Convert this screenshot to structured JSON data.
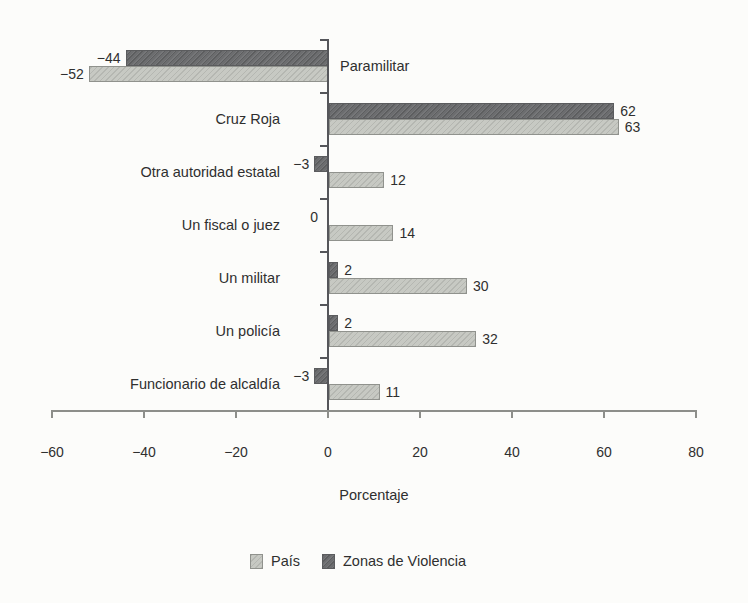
{
  "chart_data": {
    "type": "bar",
    "orientation": "horizontal",
    "title": "",
    "categories": [
      "Paramilitar",
      "Cruz Roja",
      "Otra autoridad estatal",
      "Un fiscal o juez",
      "Un militar",
      "Un policía",
      "Funcionario de alcaldía"
    ],
    "series": [
      {
        "name": "Zonas de Violencia",
        "role": "dark",
        "color": "#6c6d6f",
        "values": [
          -44,
          62,
          -3,
          0,
          2,
          2,
          -3
        ],
        "value_labels": [
          "−44",
          "62",
          "−3",
          "0",
          "2",
          "2",
          "−3"
        ]
      },
      {
        "name": "País",
        "role": "light",
        "color": "#c7c9c3",
        "values": [
          -52,
          63,
          12,
          14,
          30,
          32,
          11
        ],
        "value_labels": [
          "−52",
          "63",
          "12",
          "14",
          "30",
          "32",
          "11"
        ]
      }
    ],
    "xlabel": "Porcentaje",
    "x_ticks": {
      "values": [
        -60,
        -40,
        -20,
        0,
        20,
        40,
        60,
        80
      ],
      "labels": [
        "−60",
        "−40",
        "−20",
        "0",
        "20",
        "40",
        "60",
        "80"
      ]
    },
    "xlim": [
      -60,
      80
    ],
    "grid": false,
    "legend": {
      "position": "bottom",
      "items": [
        {
          "label": "País",
          "swatch": "light"
        },
        {
          "label": "Zonas de Violencia",
          "swatch": "dark"
        }
      ]
    },
    "colors": {
      "dark_bar": "#6c6d6f",
      "light_bar": "#c7c9c3",
      "axis": "#8d8e8a",
      "zero_line": "#55565a",
      "text": "#2f2f2f",
      "background": "#fcfcfa"
    }
  }
}
